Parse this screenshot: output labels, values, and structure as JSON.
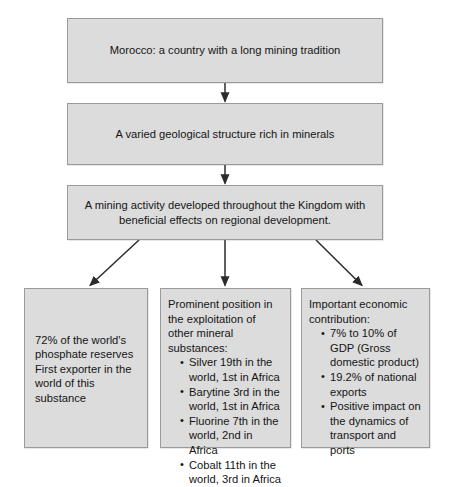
{
  "diagram": {
    "box_fill": "#dcdcdc",
    "box_border": "#9a9a9a",
    "arrow_color": "#2b2b2b",
    "nodes": {
      "tradition": {
        "text": "Morocco: a country with a long mining tradition"
      },
      "geology": {
        "text": "A varied geological structure rich in minerals"
      },
      "activity": {
        "line1": "A mining activity developed throughout the Kingdom with",
        "line2": "beneficial effects on regional development."
      },
      "phosphate": {
        "line1": "72% of the world's",
        "line2": "phosphate reserves",
        "line3": "First exporter in the",
        "line4": "world of this substance"
      },
      "minerals": {
        "lead": "Prominent position in the exploitation of other mineral substances:",
        "bullets": [
          "Silver 19th in the world, 1st in Africa",
          "Barytine 3rd in the world, 1st in Africa",
          "Fluorine 7th in the world, 2nd in Africa",
          "Cobalt 11th in the world, 3rd in Africa"
        ]
      },
      "economic": {
        "lead": "Important economic contribution:",
        "bullets": [
          "7% to 10% of GDP (Gross domestic product)",
          "19.2% of national exports",
          "Positive impact on the dynamics of transport and ports"
        ]
      }
    },
    "edges": [
      {
        "name": "tradition-to-geology",
        "from": "tradition",
        "to": "geology"
      },
      {
        "name": "geology-to-activity",
        "from": "geology",
        "to": "activity"
      },
      {
        "name": "activity-to-phosphate",
        "from": "activity",
        "to": "phosphate"
      },
      {
        "name": "activity-to-minerals",
        "from": "activity",
        "to": "minerals"
      },
      {
        "name": "activity-to-economic",
        "from": "activity",
        "to": "economic"
      }
    ]
  }
}
